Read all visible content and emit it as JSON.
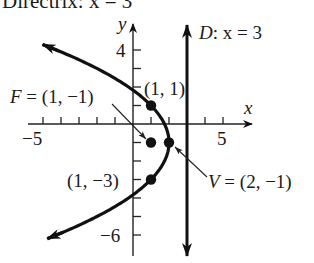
{
  "caption": {
    "text": "Directrix: x = 3"
  },
  "chart_data": {
    "type": "line",
    "title": "",
    "xlabel": "x",
    "ylabel": "y",
    "xlim": [
      -5.5,
      6.5
    ],
    "ylim": [
      -7,
      5
    ],
    "grid": false,
    "x_ticks": [
      -5,
      -4,
      -3,
      -2,
      -1,
      1,
      2,
      3,
      4,
      5
    ],
    "y_ticks": [
      4,
      3,
      2,
      1,
      -1,
      -2,
      -3,
      -4,
      -5,
      -6
    ],
    "x_tick_labels": [
      {
        "value": -5,
        "label": "−5"
      },
      {
        "value": 5,
        "label": "5"
      }
    ],
    "y_tick_labels": [
      {
        "value": 4,
        "label": "4"
      },
      {
        "value": -6,
        "label": "−6"
      }
    ],
    "series": [
      {
        "name": "parabola",
        "equation": "(y + 1)^2 = -4(x - 2)",
        "y_range": [
          -6.2,
          4.3
        ]
      },
      {
        "name": "directrix",
        "equation": "x = 3",
        "label": "D: x = 3"
      }
    ],
    "points": [
      {
        "name": "vertex",
        "x": 2,
        "y": -1,
        "label": "V = (2, −1)"
      },
      {
        "name": "focus",
        "x": 1,
        "y": -1,
        "label": "F = (1, −1)"
      },
      {
        "name": "latus-top",
        "x": 1,
        "y": 1,
        "label": "(1, 1)"
      },
      {
        "name": "latus-bottom",
        "x": 1,
        "y": -3,
        "label": "(1, −3)"
      }
    ]
  },
  "labels": {
    "y_axis": "y",
    "x_axis": "x",
    "tick_y4": "4",
    "tick_yneg6": "−6",
    "tick_xneg5": "−5",
    "tick_x5": "5",
    "directrix_D": "D",
    "directrix_rest": ": x = 3",
    "focus_F": "F",
    "focus_rest": " = (1, −1)",
    "vertex_V": "V",
    "vertex_rest": " = (2, −1)",
    "pt_top": "(1, 1)",
    "pt_bottom": "(1, −3)"
  }
}
